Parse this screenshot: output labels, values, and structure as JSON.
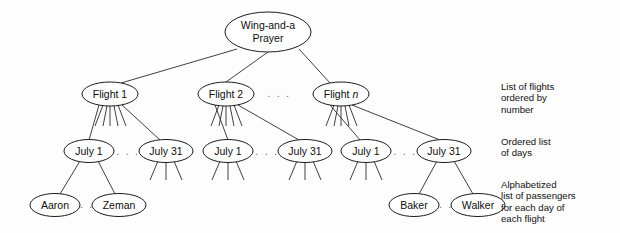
{
  "diagram": {
    "background_color": "#fdfdfd",
    "line_color": "#2a2a2a",
    "node_fill": "#ffffff",
    "ellipsis_color": "#6e6e6e",
    "ellipsis_text": ". . .",
    "ellipsis_text_short": ". .",
    "levels": [
      {
        "level": 0,
        "name": "root",
        "nodes": [
          {
            "id": "root",
            "label_line1": "Wing-and-a",
            "label_line2": "Prayer",
            "cx": 268,
            "cy": 32,
            "rx": 43,
            "ry": 20
          }
        ]
      },
      {
        "level": 1,
        "name": "flights",
        "annotation": "List of flights\nordered by\nnumber",
        "nodes": [
          {
            "id": "flight1",
            "label": "Flight 1",
            "label_prefix": "Flight ",
            "label_suffix": "1",
            "italic_suffix": false,
            "cx": 110,
            "cy": 94,
            "rx": 28,
            "ry": 12
          },
          {
            "id": "flight2",
            "label": "Flight 2",
            "label_prefix": "Flight ",
            "label_suffix": "2",
            "italic_suffix": false,
            "cx": 226,
            "cy": 94,
            "rx": 28,
            "ry": 12
          },
          {
            "id": "flightn",
            "label": "Flight n",
            "label_prefix": "Flight ",
            "label_suffix": "n",
            "italic_suffix": true,
            "cx": 341,
            "cy": 94,
            "rx": 28,
            "ry": 12
          }
        ],
        "ellipsis": [
          {
            "x": 279,
            "y": 97
          }
        ]
      },
      {
        "level": 2,
        "name": "days",
        "annotation": "Ordered list\nof days",
        "nodes": [
          {
            "id": "d1a",
            "label": "July 1",
            "cx": 89,
            "cy": 151,
            "rx": 25,
            "ry": 11.5,
            "parent": "flight1"
          },
          {
            "id": "d1b",
            "label": "July 31",
            "cx": 166,
            "cy": 151,
            "rx": 27,
            "ry": 11.5,
            "parent": "flight1"
          },
          {
            "id": "d2a",
            "label": "July 1",
            "cx": 228,
            "cy": 151,
            "rx": 25,
            "ry": 11.5,
            "parent": "flight2"
          },
          {
            "id": "d2b",
            "label": "July 31",
            "cx": 305,
            "cy": 151,
            "rx": 27,
            "ry": 11.5,
            "parent": "flight2"
          },
          {
            "id": "dna",
            "label": "July 1",
            "cx": 366,
            "cy": 151,
            "rx": 25,
            "ry": 11.5,
            "parent": "flightn"
          },
          {
            "id": "dnb",
            "label": "July 31",
            "cx": 444,
            "cy": 151,
            "rx": 27,
            "ry": 11.5,
            "parent": "flightn"
          }
        ],
        "ellipsis": [
          {
            "x": 128,
            "y": 154
          },
          {
            "x": 267,
            "y": 154
          },
          {
            "x": 405,
            "y": 154
          }
        ]
      },
      {
        "level": 3,
        "name": "passengers",
        "annotation": "Alphabetized\nlist of passengers\nfor each day of\neach flight",
        "nodes": [
          {
            "id": "aaron",
            "label": "Aaron",
            "cx": 55,
            "cy": 205,
            "rx": 25,
            "ry": 11.5,
            "parent": "d1a"
          },
          {
            "id": "zeman",
            "label": "Zeman",
            "cx": 119,
            "cy": 205,
            "rx": 27,
            "ry": 11.5,
            "parent": "d1a"
          },
          {
            "id": "baker",
            "label": "Baker",
            "cx": 414,
            "cy": 205,
            "rx": 25,
            "ry": 11.5,
            "parent": "dnb"
          },
          {
            "id": "walker",
            "label": "Walker",
            "cx": 478,
            "cy": 205,
            "rx": 27,
            "ry": 11.5,
            "parent": "dnb"
          }
        ],
        "ellipsis": [
          {
            "x": 87,
            "y": 208
          },
          {
            "x": 446,
            "y": 208
          }
        ]
      }
    ],
    "annotations": [
      {
        "id": "annotation-flights",
        "text": "List of flights\nordered by\nnumber"
      },
      {
        "id": "annotation-days",
        "text": "Ordered list\nof days"
      },
      {
        "id": "annotation-pax",
        "text": "Alphabetized\nlist of passengers\nfor each day of\neach flight"
      }
    ]
  }
}
